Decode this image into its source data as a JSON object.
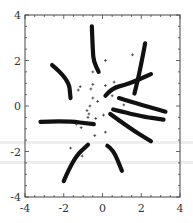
{
  "chart_data": {
    "type": "scatter",
    "title": "",
    "xlabel": "",
    "ylabel": "",
    "xlim": [
      -4,
      4
    ],
    "ylim": [
      -4,
      4
    ],
    "grid": false,
    "legend": null,
    "x_ticks": [
      -4,
      -2,
      0,
      2,
      4
    ],
    "y_ticks": [
      -4,
      -2,
      0,
      2,
      4
    ],
    "x_tick_labels": [
      "-4",
      "-2",
      "0",
      "2",
      "4"
    ],
    "y_tick_labels": [
      "-4",
      "-2",
      "0",
      "2",
      "4"
    ],
    "minor_tick_step": 0.5,
    "series": [
      {
        "name": "trajectories",
        "style": "thick-line",
        "color": "#111111",
        "lines": [
          [
            [
              -0.55,
              3.5
            ],
            [
              -0.5,
              2.4
            ],
            [
              -0.45,
              1.95
            ],
            [
              -0.2,
              1.5
            ]
          ],
          [
            [
              -2.6,
              1.8
            ],
            [
              -1.75,
              1.2
            ],
            [
              -1.65,
              0.35
            ]
          ],
          [
            [
              -3.2,
              -0.7
            ],
            [
              -1.9,
              -0.65
            ],
            [
              -0.45,
              -0.8
            ]
          ],
          [
            [
              -2.0,
              -3.3
            ],
            [
              -1.5,
              -2.3
            ],
            [
              -0.75,
              -1.7
            ]
          ],
          [
            [
              0.25,
              -1.75
            ],
            [
              0.55,
              -1.9
            ],
            [
              1.0,
              -2.85
            ]
          ],
          [
            [
              0.15,
              0.45
            ],
            [
              0.5,
              0.8
            ],
            [
              1.3,
              0.95
            ],
            [
              2.5,
              1.4
            ]
          ],
          [
            [
              2.2,
              2.75
            ],
            [
              1.95,
              1.6
            ],
            [
              1.65,
              0.55
            ]
          ],
          [
            [
              0.85,
              0.35
            ],
            [
              2.2,
              0.0
            ],
            [
              3.25,
              -0.25
            ]
          ],
          [
            [
              0.55,
              -0.15
            ],
            [
              1.95,
              -0.45
            ],
            [
              3.15,
              -0.6
            ]
          ],
          [
            [
              0.4,
              -0.35
            ],
            [
              1.45,
              -1.0
            ],
            [
              2.5,
              -1.55
            ]
          ]
        ]
      },
      {
        "name": "points",
        "style": "plus-marker",
        "color": "#333333",
        "points": [
          [
            0.15,
            2.0
          ],
          [
            1.55,
            2.25
          ],
          [
            -0.5,
            1.5
          ],
          [
            -1.15,
            0.85
          ],
          [
            -1.25,
            0.7
          ],
          [
            -0.5,
            0.95
          ],
          [
            -0.6,
            0.75
          ],
          [
            0.15,
            0.9
          ],
          [
            0.6,
            1.05
          ],
          [
            -0.5,
            0.35
          ],
          [
            -0.25,
            0.2
          ],
          [
            0.5,
            0.45
          ],
          [
            1.1,
            0.05
          ],
          [
            -0.65,
            0.0
          ],
          [
            -0.8,
            -0.2
          ],
          [
            -0.7,
            -0.35
          ],
          [
            -0.75,
            -0.5
          ],
          [
            -0.35,
            -0.55
          ],
          [
            0.05,
            -0.4
          ],
          [
            -1.35,
            -0.8
          ],
          [
            -1.1,
            -0.95
          ],
          [
            -0.4,
            -1.3
          ],
          [
            0.15,
            -1.15
          ],
          [
            -1.65,
            -1.85
          ],
          [
            -1.05,
            -2.2
          ]
        ]
      }
    ]
  },
  "plot_area": {
    "left": 25,
    "right": 180,
    "top": 15,
    "bottom": 197
  },
  "colors": {
    "frame": "#444444",
    "line": "#111111",
    "marker": "#333333",
    "band": "#eeeeee"
  }
}
